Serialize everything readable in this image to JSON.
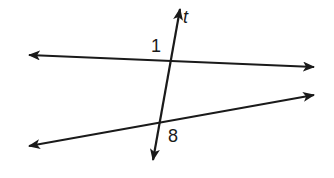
{
  "diagram": {
    "type": "parallel lines cut by transversal",
    "stroke_color": "#1a1a1a",
    "background": "#ffffff",
    "lines": [
      {
        "name": "top-line",
        "x1": 29,
        "y1": 55,
        "x2": 314,
        "y2": 67,
        "arrows": "both"
      },
      {
        "name": "bottom-line",
        "x1": 29,
        "y1": 146,
        "x2": 314,
        "y2": 95,
        "arrows": "both"
      },
      {
        "name": "transversal-t",
        "x1": 180,
        "y1": 9,
        "x2": 153,
        "y2": 160,
        "arrows": "both"
      }
    ],
    "labels": {
      "transversal": "t",
      "angle_top": "1",
      "angle_bottom": "8"
    }
  }
}
